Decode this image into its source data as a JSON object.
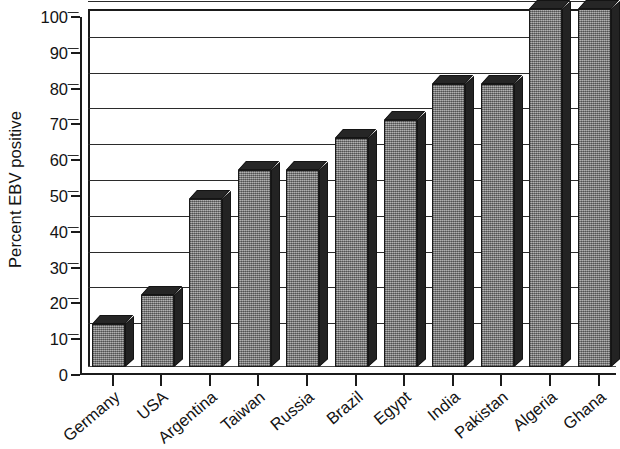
{
  "chart_data": {
    "type": "bar",
    "title": "",
    "subtitle": "",
    "xlabel": "",
    "ylabel": "Percent EBV positive",
    "ylim": [
      0,
      100
    ],
    "ytick_step": 10,
    "yticks": [
      100,
      90,
      80,
      70,
      60,
      50,
      40,
      30,
      20,
      10,
      0
    ],
    "grid": true,
    "legend": false,
    "legend_position": "none",
    "style": "3d-bar-grayscale",
    "categories": [
      "Germany",
      "USA",
      "Argentina",
      "Taiwan",
      "Russia",
      "Brazil",
      "Egypt",
      "India",
      "Pakistan",
      "Algeria",
      "Ghana"
    ],
    "values": [
      12,
      20,
      47,
      55,
      55,
      64,
      69,
      79,
      79,
      100,
      100
    ],
    "series": [
      {
        "name": "Percent EBV positive",
        "values": [
          12,
          20,
          47,
          55,
          55,
          64,
          69,
          79,
          79,
          100,
          100
        ]
      }
    ],
    "colors": {
      "bar_face": "#8b8b8b",
      "bar_side": "#232323",
      "bar_top": "#262626",
      "axis": "#1b1b1b",
      "gridline": "#2b2b2b",
      "background": "#ffffff",
      "text": "#131313"
    }
  },
  "axes": {
    "y_title": "Percent EBV positive",
    "y_tick_labels": [
      "100",
      "90",
      "80",
      "70",
      "60",
      "50",
      "40",
      "30",
      "20",
      "10",
      "0"
    ],
    "x_tick_labels": [
      "Germany",
      "USA",
      "Argentina",
      "Taiwan",
      "Russia",
      "Brazil",
      "Egypt",
      "India",
      "Pakistan",
      "Algeria",
      "Ghana"
    ]
  }
}
